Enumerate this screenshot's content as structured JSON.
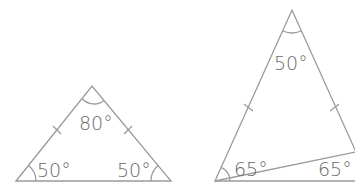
{
  "diagram": {
    "stroke_color": "#9a9a9a",
    "text_color": "#6a6a6a",
    "triangles": [
      {
        "name": "left-triangle",
        "type": "isosceles",
        "apex_angle": "80°",
        "base_left_angle": "50°",
        "base_right_angle": "50°",
        "equal_sides_marked": true
      },
      {
        "name": "right-triangle",
        "type": "isosceles",
        "apex_angle": "50°",
        "base_left_angle": "65°",
        "base_right_angle": "65°",
        "equal_sides_marked": true
      }
    ]
  }
}
